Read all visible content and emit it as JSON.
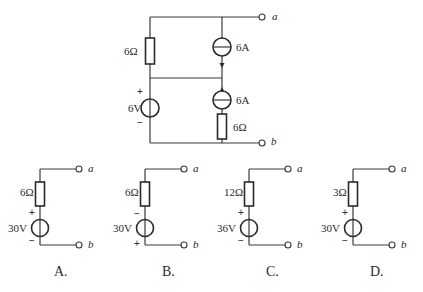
{
  "main_circuit": {
    "terminals": {
      "top": "a",
      "bottom": "b"
    },
    "left_resistor": "6Ω",
    "voltage_source": {
      "value": "6V",
      "plus": "+",
      "minus": "−"
    },
    "current_source_top": {
      "value": "6A",
      "arrow": "down"
    },
    "current_source_bottom": {
      "value": "6A",
      "arrow": "up"
    },
    "right_resistor": "6Ω"
  },
  "options": [
    {
      "label": "A.",
      "resistor": "6Ω",
      "voltage": "30V",
      "top_sign": "+",
      "bottom_sign": "−",
      "terminal_top": "a",
      "terminal_bottom": "b"
    },
    {
      "label": "B.",
      "resistor": "6Ω",
      "voltage": "30V",
      "top_sign": "−",
      "bottom_sign": "+",
      "terminal_top": "a",
      "terminal_bottom": "b"
    },
    {
      "label": "C.",
      "resistor": "12Ω",
      "voltage": "36V",
      "top_sign": "+",
      "bottom_sign": "−",
      "terminal_top": "a",
      "terminal_bottom": "b"
    },
    {
      "label": "D.",
      "resistor": "3Ω",
      "voltage": "30V",
      "top_sign": "+",
      "bottom_sign": "−",
      "terminal_top": "a",
      "terminal_bottom": "b"
    }
  ]
}
